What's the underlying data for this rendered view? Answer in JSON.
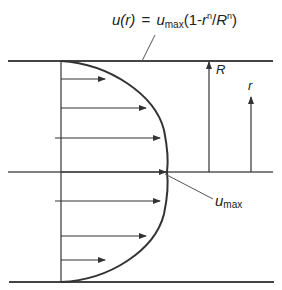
{
  "diagram": {
    "type": "velocity-profile",
    "formula": {
      "lhs": "u(r)",
      "equals": "=",
      "u": "u",
      "sub": "max",
      "open": "(1-",
      "r": "r",
      "exp1": "n",
      "slash": "/",
      "R": "R",
      "exp2": "n",
      "close": ")"
    },
    "labels": {
      "R": "R",
      "r": "r",
      "umax_u": "u",
      "umax_sub": "max"
    },
    "colors": {
      "line": "#333333",
      "wall": "#444444",
      "background": "#ffffff"
    },
    "arrows_y": [
      79,
      108,
      138,
      172,
      201,
      236,
      260
    ],
    "walls": {
      "top_y": 61,
      "center_y": 172,
      "bottom_y": 282
    }
  }
}
